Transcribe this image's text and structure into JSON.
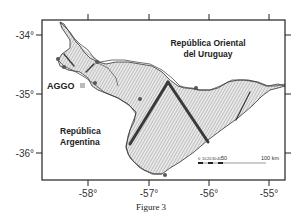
{
  "figure": {
    "caption": "Figure 3"
  },
  "map": {
    "axes": {
      "x_ticks": [
        "-58°",
        "-57°",
        "-56°",
        "-55°"
      ],
      "y_ticks": [
        "-34°",
        "-35°",
        "-36°"
      ],
      "x_range_deg": [
        -58.75,
        -54.75
      ],
      "y_range_deg": [
        -33.75,
        -36.45
      ]
    },
    "labels": {
      "uruguay_line1": "República Oriental",
      "uruguay_line2": "del Uruguay",
      "argentina_line1": "República",
      "argentina_line2": "Argentina",
      "station": "AGGO"
    },
    "scale_bar": {
      "minor_labels": [
        "0",
        "10",
        "20",
        "30",
        "40",
        "50"
      ],
      "major_label": "100 km"
    },
    "colors": {
      "frame": "#222222",
      "coast": "#333333",
      "hatch": "#8a8a8a",
      "water_fill": "#e6e6e6",
      "track": "#3a3a3a",
      "point": "#555555",
      "station_marker": "#bbbbbb"
    }
  }
}
